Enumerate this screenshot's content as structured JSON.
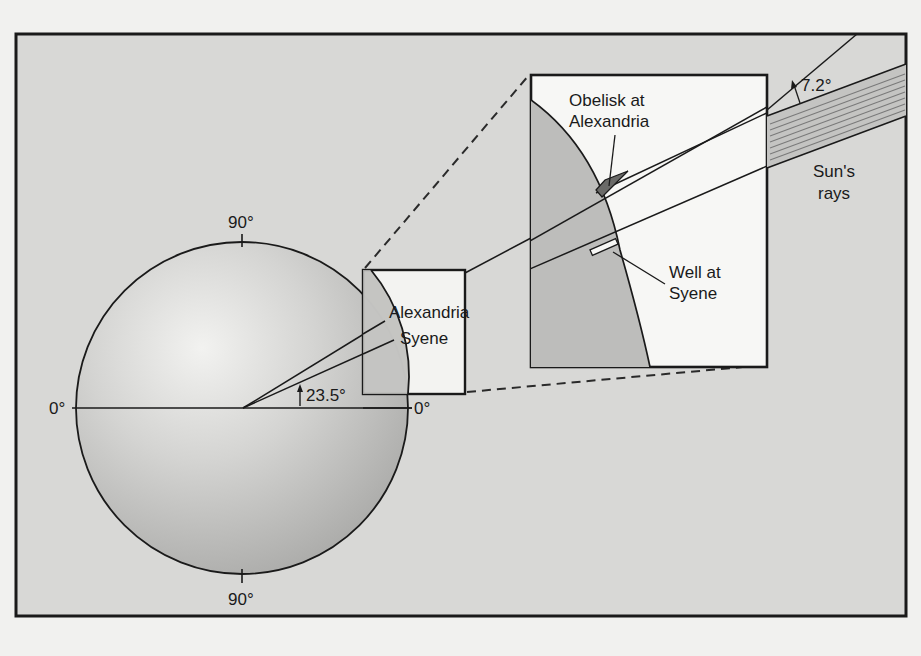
{
  "figure": {
    "colors": {
      "page_background": "#f1f1ef",
      "frame_background": "#d8d8d6",
      "earth_light": "#eeeeec",
      "earth_dark": "#b4b4b2",
      "inset_background": "#f7f7f5",
      "inset_earth": "#bdbdbb",
      "rays_band": "#c4c4c2",
      "ray_hatch": "#7a7a7a",
      "stroke": "#1a1a1a"
    },
    "globe": {
      "labels": {
        "top": "90°",
        "bottom": "90°",
        "left": "0°",
        "right": "0°"
      },
      "angle_label": "23.5°",
      "city_labels": {
        "alexandria": "Alexandria",
        "syene": "Syene"
      }
    },
    "inset": {
      "obelisk_label_line1": "Obelisk at",
      "obelisk_label_line2": "Alexandria",
      "well_label_line1": "Well at",
      "well_label_line2": "Syene"
    },
    "sun": {
      "angle_label": "7.2°",
      "rays_label_line1": "Sun's",
      "rays_label_line2": "rays"
    }
  }
}
